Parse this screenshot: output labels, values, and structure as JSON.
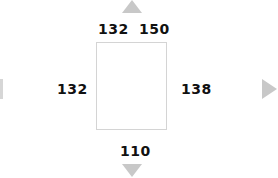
{
  "frame": {
    "top_left_value": "132",
    "top_right_value": "150",
    "left_value": "132",
    "right_value": "138",
    "bottom_value": "110"
  },
  "navigation": {
    "up_icon": "arrow-up-icon",
    "down_icon": "arrow-down-icon",
    "left_icon": "arrow-left-icon",
    "right_icon": "arrow-right-icon"
  },
  "colors": {
    "arrow": "#c8c8c8",
    "frame_border": "#d4d4d4",
    "label": "#111111"
  }
}
